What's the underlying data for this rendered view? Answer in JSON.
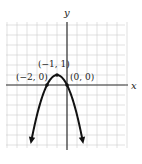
{
  "chart_data": {
    "type": "line",
    "title": "",
    "xlabel": "x",
    "ylabel": "y",
    "function": "y = -x^2 - 2x",
    "xlim": [
      -6,
      6
    ],
    "ylim": [
      -6,
      6
    ],
    "grid": true,
    "grid_step": 1,
    "legend": null,
    "series": [
      {
        "name": "parabola",
        "x": [
          -3.6,
          -3,
          -2.5,
          -2,
          -1.5,
          -1,
          -0.5,
          0,
          0.5,
          1,
          1.6
        ],
        "y": [
          -5.76,
          -3,
          -1.25,
          0,
          0.75,
          1,
          0.75,
          0,
          -1.25,
          -3,
          -5.76
        ]
      }
    ],
    "annotations": [
      {
        "text": "(−1, 1)",
        "x": -1,
        "y": 1,
        "role": "vertex"
      },
      {
        "text": "(−2, 0)",
        "x": -2,
        "y": 0,
        "role": "x-intercept"
      },
      {
        "text": "(0, 0)",
        "x": 0,
        "y": 0,
        "role": "x-intercept"
      }
    ]
  },
  "labels": {
    "x_axis": "x",
    "y_axis": "y",
    "vertex": "(−1, 1)",
    "left_intercept": "(−2, 0)",
    "right_intercept": "(0, 0)"
  },
  "colors": {
    "grid": "#cfcfcf",
    "axis": "#333333",
    "curve": "#111111"
  }
}
